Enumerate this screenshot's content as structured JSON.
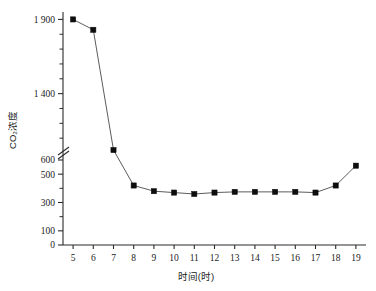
{
  "chart_data": {
    "type": "line",
    "title": "",
    "xlabel": "时间(时)",
    "ylabel": "CO₂浓度",
    "x": [
      5,
      6,
      7,
      8,
      9,
      10,
      11,
      12,
      13,
      14,
      15,
      16,
      17,
      18,
      19
    ],
    "values": [
      1900,
      1830,
      1020,
      420,
      380,
      370,
      360,
      370,
      375,
      375,
      375,
      375,
      370,
      420,
      560
    ],
    "series": [
      {
        "name": "CO₂浓度",
        "values": [
          1900,
          1830,
          1020,
          420,
          380,
          370,
          360,
          370,
          375,
          375,
          375,
          375,
          370,
          420,
          560
        ]
      }
    ],
    "xtick_labels": [
      "5",
      "6",
      "7",
      "8",
      "9",
      "10",
      "11",
      "12",
      "13",
      "14",
      "15",
      "16",
      "17",
      "18",
      "19"
    ],
    "ytick_labels_lower": [
      "0",
      "100",
      "300",
      "500",
      "600"
    ],
    "ytick_values_lower": [
      0,
      100,
      300,
      500,
      600
    ],
    "yminor_values_lower": [
      200,
      400
    ],
    "ytick_labels_upper": [
      "1 400",
      "1 900"
    ],
    "ytick_values_upper": [
      1400,
      1900
    ],
    "yminor_values_upper": [
      1100,
      1200,
      1300,
      1500,
      1600,
      1700,
      1800
    ],
    "axis_break": true,
    "axis_break_at": 650,
    "xlim": [
      4.5,
      19.5
    ],
    "ylim_lower": [
      0,
      600
    ],
    "ylim_upper": [
      1000,
      1950
    ],
    "grid": false,
    "legend": "none",
    "marker": "square",
    "marker_color": "#0d0d0d",
    "line_color": "#4a4a4a"
  },
  "axes": {
    "y_title": "CO₂浓度",
    "x_title": "时间(时)"
  }
}
